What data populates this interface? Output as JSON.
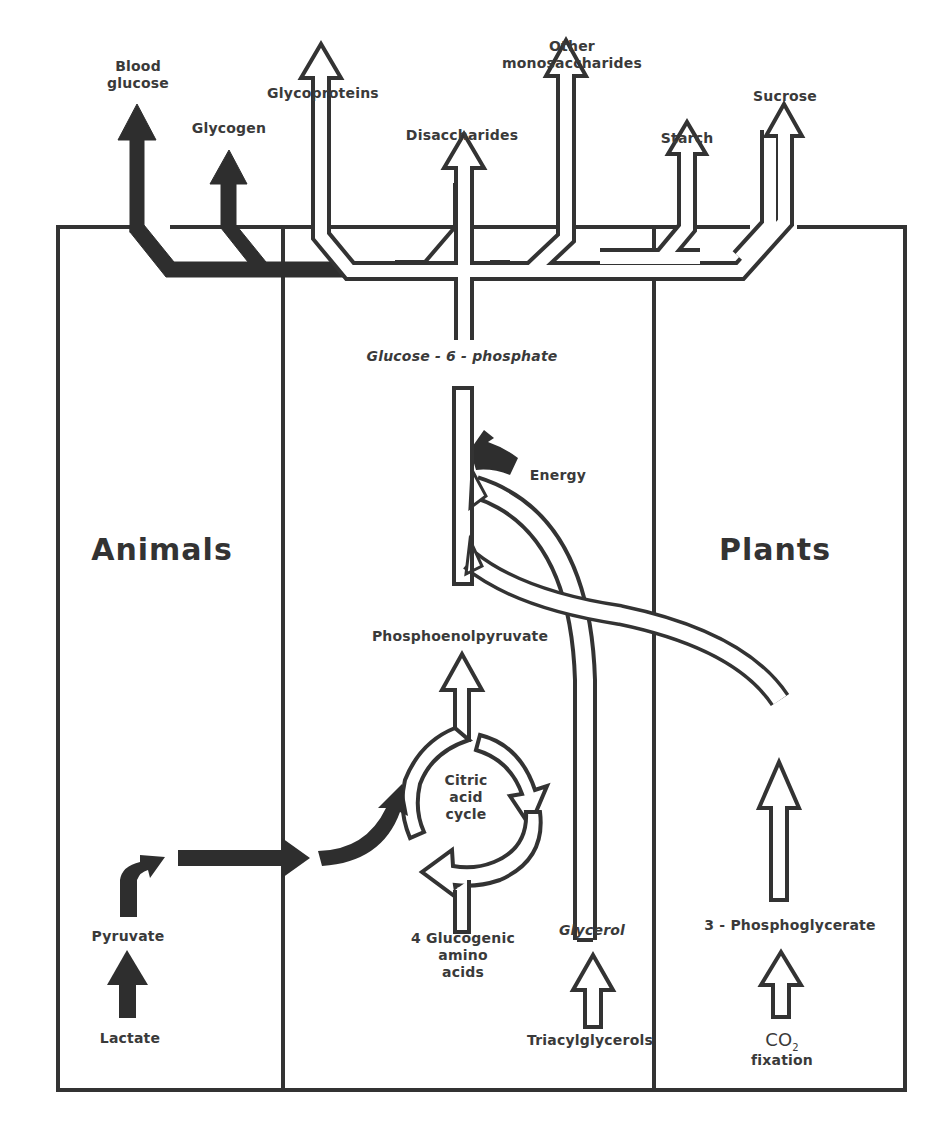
{
  "diagram": {
    "regions": {
      "left": "Animals",
      "right": "Plants"
    },
    "products": {
      "blood_glucose": "Blood\nglucose",
      "glycogen": "Glycogen",
      "glycoproteins": "Glycoproteins",
      "disaccharides": "Disaccharides",
      "other_monosaccharides": "Other\nmonosaccharides",
      "starch": "Starch",
      "sucrose": "Sucrose"
    },
    "nodes": {
      "glucose_6_phosphate": "Glucose - 6 - phosphate",
      "energy": "Energy",
      "phosphoenolpyruvate": "Phosphoenolpyruvate",
      "citric_acid_cycle": "Citric\nacid\ncycle",
      "glucogenic_amino_acids": "4 Glucogenic\namino\nacids",
      "glycerol": "Glycerol",
      "triacylglycerols": "Triacylglycerols",
      "pyruvate": "Pyruvate",
      "lactate": "Lactate",
      "phosphoglycerate": "3 - Phosphoglycerate",
      "co2": "CO",
      "co2_sub": "2",
      "fixation": "fixation"
    },
    "colors": {
      "animal_arrow": "#2e2e2e",
      "shared_arrow_fill": "#ffffff",
      "stroke": "#333333",
      "text": "#3a3a3a"
    }
  }
}
